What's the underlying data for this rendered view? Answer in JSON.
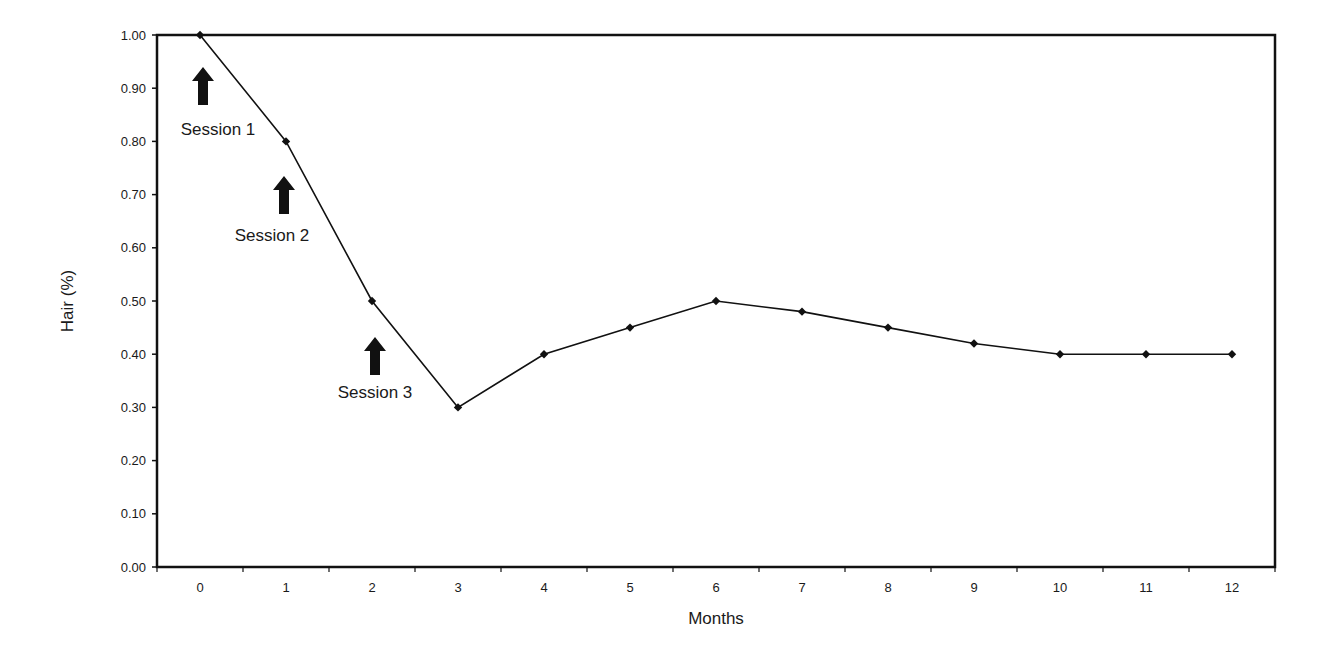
{
  "chart_data": {
    "type": "line",
    "title": "",
    "xlabel": "Months",
    "ylabel": "Hair (%)",
    "categories": [
      "0",
      "1",
      "2",
      "3",
      "4",
      "5",
      "6",
      "7",
      "8",
      "9",
      "10",
      "11",
      "12"
    ],
    "series": [
      {
        "name": "Hair (%)",
        "values": [
          1.0,
          0.8,
          0.5,
          0.3,
          0.4,
          0.45,
          0.5,
          0.48,
          0.45,
          0.42,
          0.4,
          0.4,
          0.4
        ],
        "marker": "diamond",
        "color": "#111111"
      }
    ],
    "ylim": [
      0,
      1.0
    ],
    "yticks": [
      "0.00",
      "0.10",
      "0.20",
      "0.30",
      "0.40",
      "0.50",
      "0.60",
      "0.70",
      "0.80",
      "0.90",
      "1.00"
    ],
    "grid": false,
    "legend": "none",
    "annotations": [
      {
        "label": "Session 1",
        "arrow": "up",
        "month_pos": 0.0
      },
      {
        "label": "Session 2",
        "arrow": "up",
        "month_pos": 0.95
      },
      {
        "label": "Session 3",
        "arrow": "up",
        "month_pos": 2.0
      }
    ]
  }
}
